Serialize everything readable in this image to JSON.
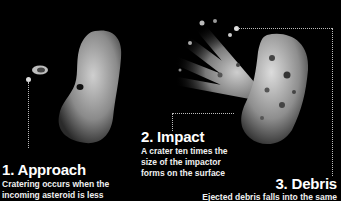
{
  "stages": [
    {
      "number": "1.",
      "title": "1. Approach",
      "description_line1": "Cratering occurs when the",
      "description_line2": "incoming asteroid is less"
    },
    {
      "number": "2.",
      "title": "2. Impact",
      "description_line1": "A crater ten times the",
      "description_line2": "size of the impactor",
      "description_line3": "forms on the surface"
    },
    {
      "number": "3.",
      "title": "3. Debris",
      "description_line1": "Ejected debris falls into the same"
    }
  ],
  "colors": {
    "background": "#000000",
    "text": "#ffffff",
    "rock": "#9a9a9a",
    "leader_line": "#bbbbbb"
  }
}
